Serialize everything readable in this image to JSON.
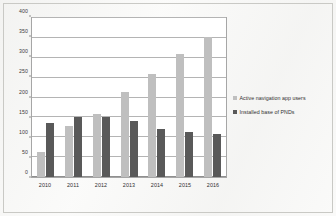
{
  "chart_data": {
    "type": "bar",
    "title": "",
    "xlabel": "",
    "ylabel": "",
    "ylim": [
      0,
      400
    ],
    "yticks": [
      0,
      50,
      100,
      150,
      200,
      250,
      300,
      350,
      400
    ],
    "grid": true,
    "legend_position": "right",
    "categories": [
      "2010",
      "2011",
      "2012",
      "2013",
      "2014",
      "2015",
      "2016"
    ],
    "series": [
      {
        "name": "Active navigation app users",
        "color": "#bfbfbf",
        "values": [
          62,
          128,
          158,
          215,
          260,
          310,
          352
        ]
      },
      {
        "name": "Installed base of PNDs",
        "color": "#595959",
        "values": [
          135,
          150,
          150,
          141,
          122,
          112,
          107
        ]
      }
    ]
  },
  "legend": {
    "items": [
      {
        "label": "Active navigation app users",
        "color": "#bfbfbf"
      },
      {
        "label": "Installed base of PNDs",
        "color": "#595959"
      }
    ]
  }
}
